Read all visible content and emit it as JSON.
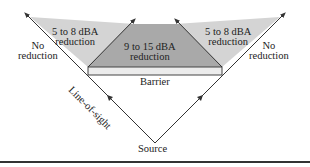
{
  "diagram": {
    "labels": {
      "left_zone_line1": "5 to 8 dBA",
      "left_zone_line2": "reduction",
      "center_zone_line1": "9 to 15 dBA",
      "center_zone_line2": "reduction",
      "right_zone_line1": "5 to 8 dBA",
      "right_zone_line2": "reduction",
      "left_none_line1": "No",
      "left_none_line2": "reduction",
      "right_none_line1": "No",
      "right_none_line2": "reduction",
      "barrier": "Barrier",
      "line_of_sight": "Line-of-sight",
      "source": "Source"
    },
    "colors": {
      "light_zone": "#d4d4d4",
      "dark_zone": "#a9a9a9",
      "barrier_fill": "#ececec",
      "line": "#333333"
    }
  }
}
